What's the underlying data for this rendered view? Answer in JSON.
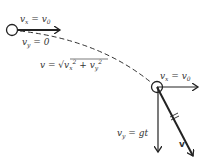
{
  "diagram": {
    "colors": {
      "stroke": "#222222",
      "text": "#333333",
      "background": "#ffffff"
    },
    "start_point": {
      "label_vx": "v",
      "label_vx_sub": "x",
      "label_vx_eq": " = v",
      "label_vx_eq_sub": "0",
      "label_vy": "v",
      "label_vy_sub": "y",
      "label_vy_eq": " = 0"
    },
    "trajectory": {
      "style": "dashed",
      "formula_prefix": "v = ",
      "formula_radical": "√",
      "formula_vx": "v",
      "formula_vx_sub": "x",
      "formula_vx_sup": "2",
      "formula_plus": " + ",
      "formula_vy": "v",
      "formula_vy_sub": "y",
      "formula_vy_sup": "2"
    },
    "later_point": {
      "label_vx": "v",
      "label_vx_sub": "x",
      "label_vx_eq": " = v",
      "label_vx_eq_sub": "0",
      "label_vy": "v",
      "label_vy_sub": "y",
      "label_vy_eq": " = gt",
      "label_v": "v"
    }
  }
}
